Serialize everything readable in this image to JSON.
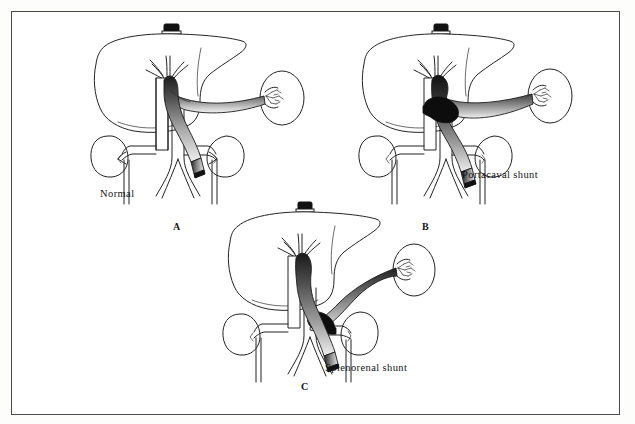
{
  "figure": {
    "title_visible": false,
    "background_color": "#ffffff",
    "frame_color": "#4a4a4a",
    "ink_color": "#232323",
    "panel_count": 3
  },
  "panels": [
    {
      "letter": "A",
      "caption": "Normal",
      "description_visible": false,
      "organs": [
        "liver",
        "spleen",
        "left kidney",
        "right kidney"
      ],
      "vessels": [
        "inferior vena cava",
        "aorta",
        "portal vein",
        "splenic vein",
        "superior mesenteric vein",
        "hepatic veins",
        "renal veins",
        "iliac vessels"
      ],
      "shunt": "none"
    },
    {
      "letter": "B",
      "caption": "Portacaval shunt",
      "description_visible": false,
      "organs": [
        "liver",
        "spleen",
        "left kidney",
        "right kidney"
      ],
      "vessels": [
        "inferior vena cava",
        "aorta",
        "portal vein",
        "splenic vein",
        "superior mesenteric vein",
        "hepatic veins",
        "renal veins",
        "iliac vessels"
      ],
      "shunt": "portal vein to inferior vena cava"
    },
    {
      "letter": "C",
      "caption": "Splenorenal shunt",
      "description_visible": false,
      "organs": [
        "liver",
        "spleen",
        "left kidney",
        "right kidney"
      ],
      "vessels": [
        "inferior vena cava",
        "aorta",
        "portal vein",
        "splenic vein",
        "superior mesenteric vein",
        "hepatic veins",
        "renal veins",
        "iliac vessels"
      ],
      "shunt": "splenic vein to left renal vein"
    }
  ]
}
